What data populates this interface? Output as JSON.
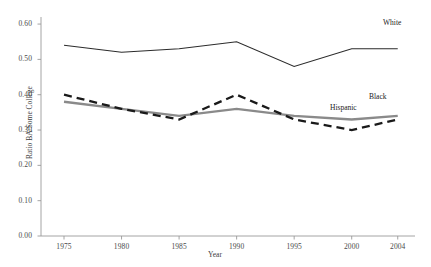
{
  "chart_data": {
    "type": "line",
    "title": "",
    "xlabel": "Year",
    "ylabel": "Ratio BA/Some College",
    "xlim": [
      1973,
      2005.5
    ],
    "ylim": [
      0.0,
      0.62
    ],
    "grid": false,
    "legend_position": "inline-right",
    "x": [
      1975,
      1980,
      1985,
      1990,
      1995,
      2000,
      2004
    ],
    "xtick_labels": [
      "1975",
      "1980",
      "1985",
      "1990",
      "1995",
      "2000",
      "2004"
    ],
    "ytick_labels": [
      "0.00",
      "0.10",
      "0.20",
      "0.30",
      "0.40",
      "0.50",
      "0.60"
    ],
    "ytick_values": [
      0.0,
      0.1,
      0.2,
      0.3,
      0.4,
      0.5,
      0.6
    ],
    "series": [
      {
        "name": "White",
        "style": "solid-thin",
        "color": "#2b2b2b",
        "values": [
          0.54,
          0.52,
          0.53,
          0.55,
          0.48,
          0.53,
          0.53
        ]
      },
      {
        "name": "Black",
        "style": "solid-thick-gray",
        "color": "#8a8a8a",
        "values": [
          0.38,
          0.36,
          0.34,
          0.36,
          0.34,
          0.33,
          0.34
        ]
      },
      {
        "name": "Hispanic",
        "style": "dashed-thick-black",
        "color": "#1a1a1a",
        "values": [
          0.4,
          0.36,
          0.33,
          0.4,
          0.33,
          0.3,
          0.33
        ]
      }
    ]
  },
  "labels": {
    "white": "White",
    "black": "Black",
    "hispanic": "Hispanic"
  }
}
